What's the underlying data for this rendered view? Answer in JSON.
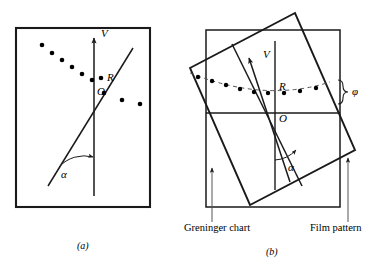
{
  "figure": {
    "type": "diagram",
    "background_color": "#ffffff",
    "line_color": "#1a1a1a",
    "dot_color": "#000000",
    "dashed_curve_color": "#555555"
  },
  "panels": [
    {
      "id": "a",
      "caption": "(a)",
      "frame": {
        "x": 16,
        "y": 28,
        "w": 134,
        "h": 179
      },
      "axis_label_vertical": "V",
      "label_reflection": "R",
      "label_origin": "O",
      "label_angle": "α",
      "description": "Film pattern alone: a zone of Laue spots forming a straight row, vertical V axis and an inclined zone line through O making angle alpha with the vertical.",
      "spots_upper_left": [
        {
          "x": 42,
          "y": 45
        },
        {
          "x": 52,
          "y": 53
        },
        {
          "x": 62,
          "y": 60
        },
        {
          "x": 72,
          "y": 67
        },
        {
          "x": 82,
          "y": 74
        },
        {
          "x": 92,
          "y": 80
        }
      ],
      "spots_right": [
        {
          "x": 104,
          "y": 93
        },
        {
          "x": 122,
          "y": 100
        },
        {
          "x": 140,
          "y": 104
        }
      ],
      "origin": {
        "x": 94,
        "y": 87
      },
      "vertical_axis": {
        "x": 94,
        "y_top": 36,
        "y_bottom": 196
      },
      "zone_line": {
        "x1": 48,
        "y1": 186,
        "x2": 133,
        "y2": 48
      }
    },
    {
      "id": "b",
      "caption": "(b)",
      "frame_chart": {
        "x": 206,
        "y": 30,
        "w": 134,
        "h": 177
      },
      "rotation_deg": -14,
      "axis_label_vertical": "V",
      "label_reflection": "R",
      "label_origin": "O",
      "label_angle": "α",
      "label_phi": "φ",
      "annotation_left": "Greninger chart",
      "annotation_right": "Film pattern",
      "description": "Greninger chart overlaid on the film pattern; the chart is rotated so that its horizontal reference line passes through O. Spots lie along a hyperbola-like dashed curve displaced by angle phi.",
      "spots_curve": [
        {
          "x": 198,
          "y": 77
        },
        {
          "x": 211,
          "y": 81
        },
        {
          "x": 224,
          "y": 85
        },
        {
          "x": 237,
          "y": 88
        },
        {
          "x": 250,
          "y": 91
        },
        {
          "x": 263,
          "y": 92
        },
        {
          "x": 276,
          "y": 92
        },
        {
          "x": 289,
          "y": 91
        },
        {
          "x": 302,
          "y": 90
        },
        {
          "x": 315,
          "y": 88
        }
      ],
      "origin": {
        "x": 275,
        "y": 113
      },
      "vertical_axis": {
        "x": 275,
        "y_top": 41,
        "y_bottom": 190
      }
    }
  ],
  "caption_a": "(a)",
  "caption_b": "(b)"
}
